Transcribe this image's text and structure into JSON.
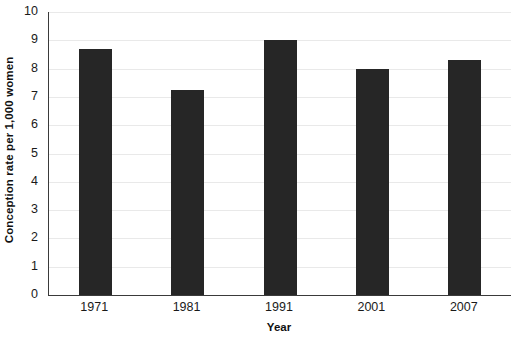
{
  "chart_data": {
    "type": "bar",
    "title": "",
    "subtitle": "",
    "xlabel": "Year",
    "ylabel": "Conception rate per 1,000 women",
    "categories": [
      "1971",
      "1981",
      "1991",
      "2001",
      "2007"
    ],
    "values": [
      8.7,
      7.25,
      9.0,
      8.0,
      8.3
    ],
    "series": [
      {
        "name": "Conception rate",
        "values": [
          8.7,
          7.25,
          9.0,
          8.0,
          8.3
        ]
      }
    ],
    "ylim": [
      0,
      10
    ],
    "xlim_categories": 5,
    "y_ticks": [
      0,
      1,
      2,
      3,
      4,
      5,
      6,
      7,
      8,
      9,
      10
    ],
    "y_tick_labels": [
      "0",
      "1",
      "2",
      "3",
      "4",
      "5",
      "6",
      "7",
      "8",
      "9",
      "10"
    ],
    "x_tick_labels": [
      "1971",
      "1981",
      "1991",
      "2001",
      "2007"
    ],
    "grid": true,
    "grid_axis": "y",
    "legend": false,
    "legend_position": "none",
    "annotations": [],
    "colors": {
      "bar": "#262626",
      "gridline": "#e9e9e9",
      "axis": "#3a3a3a",
      "background": "#ffffff",
      "text": "#1a1a1a"
    }
  },
  "axes": {
    "y_title": "Conception rate per 1,000 women",
    "x_title": "Year"
  },
  "y_ticks": [
    {
      "label": "10",
      "value": 10
    },
    {
      "label": "9",
      "value": 9
    },
    {
      "label": "8",
      "value": 8
    },
    {
      "label": "7",
      "value": 7
    },
    {
      "label": "6",
      "value": 6
    },
    {
      "label": "5",
      "value": 5
    },
    {
      "label": "4",
      "value": 4
    },
    {
      "label": "3",
      "value": 3
    },
    {
      "label": "2",
      "value": 2
    },
    {
      "label": "1",
      "value": 1
    },
    {
      "label": "0",
      "value": 0
    }
  ],
  "bars": [
    {
      "label": "1971",
      "value": 8.7
    },
    {
      "label": "1981",
      "value": 7.25
    },
    {
      "label": "1991",
      "value": 9.0
    },
    {
      "label": "2001",
      "value": 8.0
    },
    {
      "label": "2007",
      "value": 8.3
    }
  ]
}
